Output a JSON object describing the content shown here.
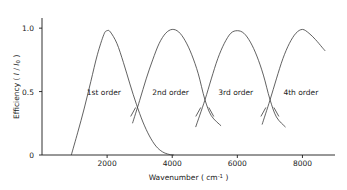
{
  "chart_data": {
    "type": "line",
    "title": "",
    "xlabel": "Wavenumber ( cm⁻¹ )",
    "ylabel": "Efficiency ( I / I₀ )",
    "xlim": [
      0,
      9000
    ],
    "ylim": [
      0,
      1.08
    ],
    "grid": false,
    "legend_position": "inline-annotations",
    "xticks": [
      2000,
      4000,
      6000,
      8000
    ],
    "xtick_labels": [
      "2000",
      "4000",
      "6000",
      "8000"
    ],
    "yticks": [
      0,
      0.5,
      1.0
    ],
    "ytick_labels": [
      "0",
      "0.5",
      "1.0"
    ],
    "series": [
      {
        "name": "1st order",
        "peak_x": 2000,
        "peak_y": 0.98,
        "x_start": 900,
        "x_end": 4050,
        "x": [
          900,
          1100,
          1300,
          1500,
          1700,
          1900,
          2000,
          2100,
          2300,
          2500,
          2700,
          2900,
          3100,
          3300,
          3500,
          3700,
          3900,
          4050
        ],
        "values": [
          0.0,
          0.18,
          0.37,
          0.58,
          0.79,
          0.95,
          0.98,
          0.97,
          0.88,
          0.73,
          0.56,
          0.4,
          0.26,
          0.15,
          0.07,
          0.025,
          0.005,
          0.0
        ]
      },
      {
        "name": "2nd order",
        "peak_x": 4000,
        "peak_y": 0.99,
        "x_start": 2780,
        "x_end": 5500,
        "x": [
          2780,
          3000,
          3200,
          3400,
          3600,
          3800,
          4000,
          4200,
          4400,
          4600,
          4800,
          5000,
          5200,
          5500
        ],
        "values": [
          0.25,
          0.43,
          0.6,
          0.75,
          0.88,
          0.96,
          0.99,
          0.97,
          0.9,
          0.79,
          0.64,
          0.44,
          0.31,
          0.23
        ]
      },
      {
        "name": "3rd order",
        "peak_x": 6000,
        "peak_y": 0.98,
        "x_start": 4720,
        "x_end": 7480,
        "x": [
          4720,
          5000,
          5200,
          5400,
          5600,
          5800,
          6000,
          6200,
          6400,
          6600,
          6800,
          7000,
          7200,
          7480
        ],
        "values": [
          0.22,
          0.43,
          0.6,
          0.76,
          0.88,
          0.96,
          0.98,
          0.96,
          0.89,
          0.78,
          0.63,
          0.44,
          0.3,
          0.22
        ]
      },
      {
        "name": "4th order",
        "peak_x": 8000,
        "peak_y": 0.99,
        "x_start": 6760,
        "x_end": 8700,
        "x": [
          6760,
          7000,
          7200,
          7400,
          7600,
          7800,
          8000,
          8200,
          8400,
          8600,
          8700
        ],
        "values": [
          0.24,
          0.43,
          0.6,
          0.76,
          0.88,
          0.96,
          0.99,
          0.96,
          0.91,
          0.85,
          0.82
        ]
      }
    ],
    "crossings": [
      {
        "x": 3000,
        "y": 0.43
      },
      {
        "x": 5000,
        "y": 0.43
      },
      {
        "x": 7000,
        "y": 0.43
      }
    ],
    "annotations": [
      {
        "text": "1st order",
        "x": 1900,
        "y": 0.5
      },
      {
        "text": "2nd order",
        "x": 3950,
        "y": 0.5
      },
      {
        "text": "3rd order",
        "x": 5950,
        "y": 0.5
      },
      {
        "text": "4th order",
        "x": 7950,
        "y": 0.5
      }
    ]
  },
  "axes": {
    "x_title_plain": "Wavenumber ( cm",
    "x_title_sup": "-1",
    "x_title_tail": " )",
    "y_title_plain": "Efficiency ( ",
    "y_title_i": "I",
    "y_title_slash": " / ",
    "y_title_i0": "I",
    "y_title_sub": "0",
    "y_title_tail": " )"
  },
  "colors": {
    "axis": "#1a1a1a",
    "curve": "#3a3a3a",
    "background": "#ffffff",
    "text": "#1a1a1a"
  }
}
